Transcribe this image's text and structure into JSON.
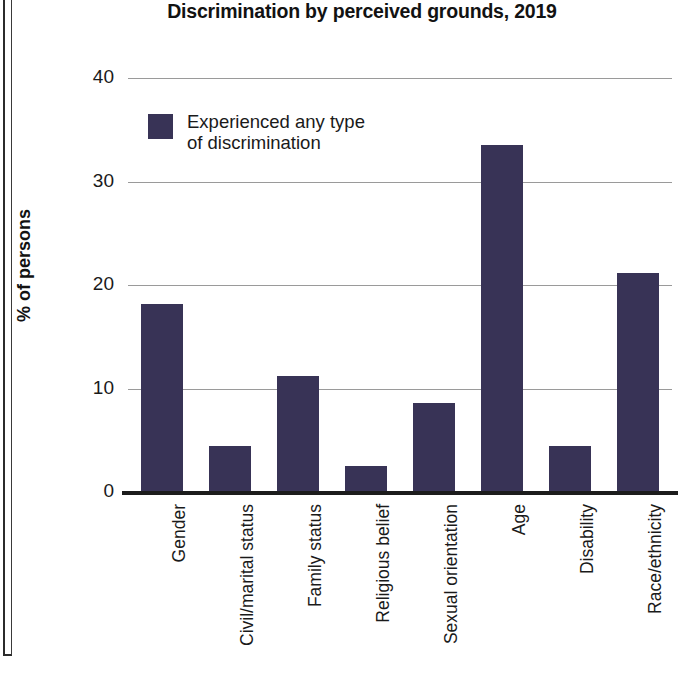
{
  "chart_data": {
    "type": "bar",
    "title": "Discrimination by perceived grounds, 2019",
    "xlabel": "",
    "ylabel": "% of persons",
    "ylim": [
      0,
      40
    ],
    "yticks": [
      0,
      10,
      20,
      30,
      40
    ],
    "ytick_labels": [
      "0",
      "10",
      "20",
      "30",
      "40"
    ],
    "grid": true,
    "legend_position": "top-left",
    "series": [
      {
        "name": "Experienced any type of discrimination",
        "color": "#383356",
        "values": [
          18.2,
          4.4,
          11.2,
          2.5,
          8.6,
          33.5,
          4.4,
          21.2
        ]
      }
    ],
    "categories": [
      "Gender",
      "Civil/marital status",
      "Family status",
      "Religious belief",
      "Sexual orientation",
      "Age",
      "Disability",
      "Race/ethnicity"
    ]
  },
  "legend": {
    "label_line1": "Experienced any type",
    "label_line2": "of discrimination",
    "swatch_color": "#383356"
  },
  "axis": {
    "y_title": "% of persons"
  }
}
